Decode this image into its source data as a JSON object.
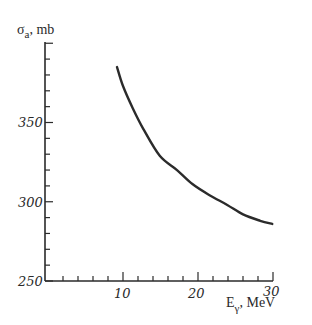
{
  "chart_data": {
    "type": "line",
    "title": "",
    "ylabel": {
      "symbol": "σ",
      "subscript": "a",
      "unit": ", mb"
    },
    "xlabel": {
      "symbol": "E",
      "subscript": "γ",
      "unit": ", MeV"
    },
    "xlim": [
      0,
      30
    ],
    "ylim": [
      250,
      400
    ],
    "x_major_ticks": [
      10,
      20,
      30
    ],
    "x_minor_step": 2,
    "y_major_ticks": [
      250,
      300,
      350,
      400
    ],
    "y_tick_labels": [
      "250",
      "300",
      "350"
    ],
    "y_minor_step": 10,
    "grid": false,
    "legend": null,
    "series": [
      {
        "name": "sigma_a",
        "x": [
          9.2,
          10.0,
          11.3,
          12.7,
          14.9,
          17.2,
          19.3,
          21.6,
          23.9,
          26.0,
          28.3,
          29.9
        ],
        "y": [
          385,
          373,
          359,
          346,
          329,
          320,
          311,
          304,
          298,
          292,
          288,
          286
        ]
      }
    ]
  },
  "labels": {
    "y_symbol": "σ",
    "y_sub": "a",
    "y_unit": ", mb",
    "x_symbol": "E",
    "x_sub": "γ",
    "x_unit": ", MeV",
    "y_250": "250",
    "y_300": "300",
    "y_350": "350",
    "x_10": "10",
    "x_20": "20",
    "x_30": "30"
  }
}
